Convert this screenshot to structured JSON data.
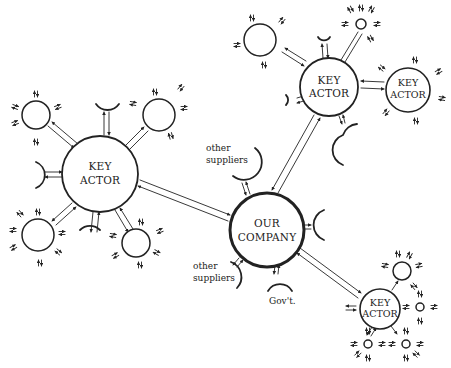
{
  "diagram": {
    "type": "stakeholder network",
    "stroke_color": "#222222",
    "background": "#ffffff",
    "center_node": {
      "id": "our-company",
      "label_lines": [
        "OUR",
        "COMPANY"
      ]
    },
    "key_actors": [
      {
        "id": "key-actor-left",
        "label_lines": [
          "KEY",
          "ACTOR"
        ]
      },
      {
        "id": "key-actor-top",
        "label_lines": [
          "KEY",
          "ACTOR"
        ]
      },
      {
        "id": "key-actor-far-right",
        "label_lines": [
          "KEY",
          "ACTOR"
        ]
      },
      {
        "id": "key-actor-bottom-right",
        "label_lines": [
          "KEY",
          "ACTOR"
        ]
      }
    ],
    "labels": {
      "other_suppliers_top": [
        "other",
        "suppliers"
      ],
      "other_suppliers_bottom": [
        "other",
        "suppliers"
      ],
      "government": "Gov't."
    }
  }
}
